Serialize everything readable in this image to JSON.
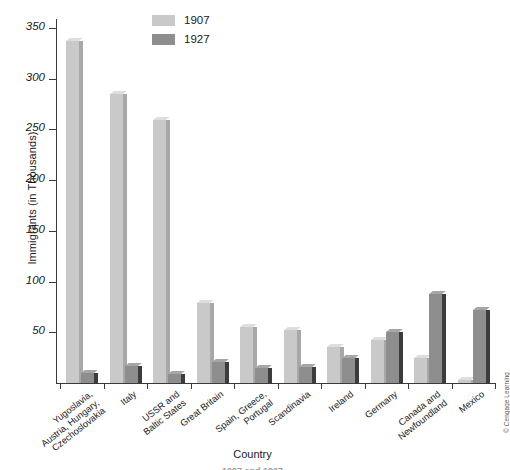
{
  "chart_data": {
    "type": "bar",
    "title": "",
    "xlabel": "Country",
    "ylabel": "Immigrants (in Thousands)",
    "ylim": [
      0,
      350
    ],
    "yticks": [
      50,
      100,
      150,
      200,
      250,
      300,
      350
    ],
    "grid": false,
    "legend_position": "top-center",
    "categories": [
      "Yugoslavia,\nAustria, Hungary,\nCzechoslovakia",
      "Italy",
      "USSR and\nBaltic States",
      "Great Britain",
      "Spain, Greece,\nPortugal",
      "Scandinavia",
      "Ireland",
      "Germany",
      "Canada and\nNewfoundland",
      "Mexico"
    ],
    "series": [
      {
        "name": "1907",
        "color": "#c9c9c9",
        "values": [
          337,
          285,
          259,
          79,
          55,
          52,
          36,
          42,
          25,
          3
        ]
      },
      {
        "name": "1927",
        "color": "#8e8e8e",
        "values": [
          10,
          17,
          9,
          21,
          15,
          16,
          25,
          50,
          88,
          72
        ]
      }
    ]
  },
  "legend": {
    "items": [
      {
        "label": "1907",
        "color": "#c9c9c9"
      },
      {
        "label": "1927",
        "color": "#8e8e8e"
      }
    ]
  },
  "axes": {
    "y_title": "Immigrants (in Thousands)",
    "x_title": "Country",
    "y_tick_labels": [
      "350",
      "300",
      "250",
      "200",
      "150",
      "100",
      "50"
    ]
  },
  "credit": "© Cengage Learning",
  "footer_clipped": "1907 and 1927"
}
